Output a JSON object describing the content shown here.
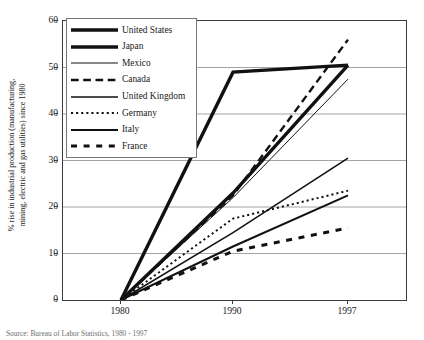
{
  "chart_data": {
    "type": "line",
    "title": "",
    "xlabel": "",
    "ylabel": "% rise in industrial production (manufacturing, mining, electric and gas utilities) since 1980",
    "x": [
      "1980",
      "1990",
      "1997"
    ],
    "xtick_labels": [
      "1980",
      "1990",
      "1997"
    ],
    "ytick_labels": [
      "0",
      "10",
      "20",
      "30",
      "40",
      "50",
      "60"
    ],
    "ylim": [
      0,
      60
    ],
    "ystep": 10,
    "grid": "horizontal",
    "legend_position": "top-left-inside",
    "series": [
      {
        "name": "United States",
        "values": [
          0,
          23.0,
          50.5
        ],
        "style": "solid",
        "width": 3.4,
        "color": "#111111"
      },
      {
        "name": "Japan",
        "values": [
          0,
          49.0,
          50.5
        ],
        "style": "solid",
        "width": 3.4,
        "color": "#111111"
      },
      {
        "name": "Mexico",
        "values": [
          0,
          22.0,
          47.5
        ],
        "style": "solid",
        "width": 1.0,
        "color": "#111111"
      },
      {
        "name": "Canada",
        "values": [
          0,
          22.5,
          56.0
        ],
        "style": "dashed",
        "width": 2.4,
        "color": "#111111"
      },
      {
        "name": "United Kingdom",
        "values": [
          0,
          14.5,
          30.5
        ],
        "style": "solid",
        "width": 1.6,
        "color": "#111111"
      },
      {
        "name": "Germany",
        "values": [
          0,
          17.5,
          23.5
        ],
        "style": "dotted",
        "width": 2.0,
        "color": "#111111"
      },
      {
        "name": "Italy",
        "values": [
          0,
          11.5,
          22.5
        ],
        "style": "solid",
        "width": 2.0,
        "color": "#111111"
      },
      {
        "name": "France",
        "values": [
          0,
          10.5,
          15.5
        ],
        "style": "dashed-thick",
        "width": 3.0,
        "color": "#111111"
      }
    ]
  },
  "yaxis": {
    "title": "% rise in industrial production (manufacturing,\nmining, electric and gas utilities) since 1980",
    "title_line1": "% rise in industrial production (manufacturing,",
    "title_line2": "mining, electric and gas utilities) since 1980",
    "ticks": [
      "60",
      "50",
      "40",
      "30",
      "20",
      "10",
      "0"
    ]
  },
  "xaxis": {
    "ticks": [
      "1980",
      "1990",
      "1997"
    ]
  },
  "legend": {
    "items": [
      {
        "label": "United States"
      },
      {
        "label": "Japan"
      },
      {
        "label": "Mexico"
      },
      {
        "label": "Canada"
      },
      {
        "label": "United Kingdom"
      },
      {
        "label": "Germany"
      },
      {
        "label": "Italy"
      },
      {
        "label": "France"
      }
    ]
  },
  "caption": {
    "text": "Source: Bureau of Labor Statistics, 1980 - 1997"
  },
  "colors": {
    "line": "#111111",
    "axis": "#3a3a3a",
    "grid": "#9a9a9a",
    "background": "#ffffff"
  }
}
